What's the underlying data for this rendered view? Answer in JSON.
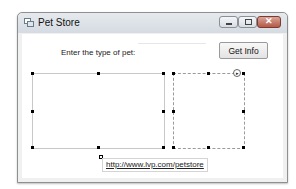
{
  "window": {
    "title": "Pet Store",
    "icon": "form-icon",
    "controls": {
      "minimize": "minimize-icon",
      "maximize": "maximize-icon",
      "close": "close-icon",
      "close_glyph": "✕"
    }
  },
  "form": {
    "pet_label": "Enter the type of pet:",
    "pet_input_value": "",
    "get_info_button": "Get Info",
    "smart_tag_glyph": "▸",
    "link_text": "http://www.lvp.com/petstore"
  }
}
